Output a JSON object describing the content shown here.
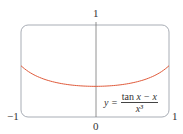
{
  "chart_data": {
    "type": "line",
    "title": "",
    "equation": "y = (tan x − x) / x³",
    "xlabel": "",
    "ylabel": "",
    "xlim": [
      -1,
      1
    ],
    "ylim": [
      0,
      1
    ],
    "grid": false,
    "tick_labels": {
      "x_left": "−1",
      "x_right": "1",
      "x_origin": "0",
      "y_top": "1"
    },
    "series": [
      {
        "name": "y = (tan x − x)/x³",
        "color": "#e05a3a",
        "x": [
          -1,
          -0.75,
          -0.5,
          -0.25,
          0,
          0.25,
          0.5,
          0.75,
          1
        ],
        "y": [
          0.557,
          0.438,
          0.37,
          0.342,
          0.333,
          0.342,
          0.37,
          0.438,
          0.557
        ]
      }
    ]
  },
  "labels": {
    "y_top": "1",
    "x_left": "−1",
    "x_right": "1",
    "x_origin": "0",
    "eq_lhs": "y =",
    "eq_num_tan": "tan",
    "eq_num_rest": "x − x",
    "eq_den": "x³"
  },
  "colors": {
    "curve": "#e05a3a",
    "frame": "#9aa0a8",
    "axis": "#666666"
  }
}
